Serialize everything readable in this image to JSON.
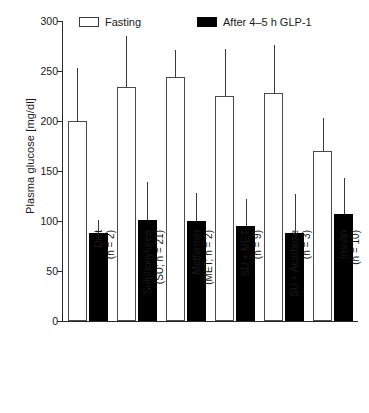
{
  "chart_data": {
    "type": "bar",
    "title": "",
    "xlabel": "",
    "ylabel": "Plasma glucose [mg/dl]",
    "ylim": [
      0,
      300
    ],
    "yticks": [
      0,
      50,
      100,
      150,
      200,
      250,
      300
    ],
    "ytick_labels": [
      "0",
      "50",
      "100",
      "150",
      "200",
      "250",
      "300"
    ],
    "grid": false,
    "legend_position": "top-left",
    "error_bars": "upper-only",
    "categories": [
      "Diet\n(n = 2)",
      "Sulphonylurea\n(SU; n = 21)",
      "Metformin\n(MET; n = 2)",
      "SU + MET\n(n = 9)",
      "SU + Acarbose\n(n = 3)",
      "Insulin\n(n = 10)"
    ],
    "category_lines": [
      {
        "line1": "Diet",
        "line2": "(n = 2)"
      },
      {
        "line1": "Sulphonylurea",
        "line2": "(SU; n = 21)"
      },
      {
        "line1": "Metformin",
        "line2": "(MET; n = 2)"
      },
      {
        "line1": "SU + MET",
        "line2": "(n = 9)"
      },
      {
        "line1": "SU + Acarbose",
        "line2": "(n = 3)"
      },
      {
        "line1": "Insulin",
        "line2": "(n = 10)"
      }
    ],
    "series": [
      {
        "name": "Fasting",
        "color": "#ffffff",
        "edge_color": "#4a4a4a",
        "values": [
          200,
          234,
          244,
          225,
          228,
          170
        ],
        "errors": [
          53,
          51,
          27,
          47,
          48,
          33
        ]
      },
      {
        "name": "After 4–5 h GLP-1",
        "color": "#000000",
        "edge_color": "#000000",
        "values": [
          88,
          101,
          100,
          95,
          88,
          107
        ],
        "errors": [
          13,
          38,
          28,
          27,
          39,
          36
        ]
      }
    ]
  },
  "legend": {
    "items": [
      {
        "label": "Fasting",
        "style": "open"
      },
      {
        "label": "After 4–5 h GLP-1",
        "style": "filled"
      }
    ]
  }
}
